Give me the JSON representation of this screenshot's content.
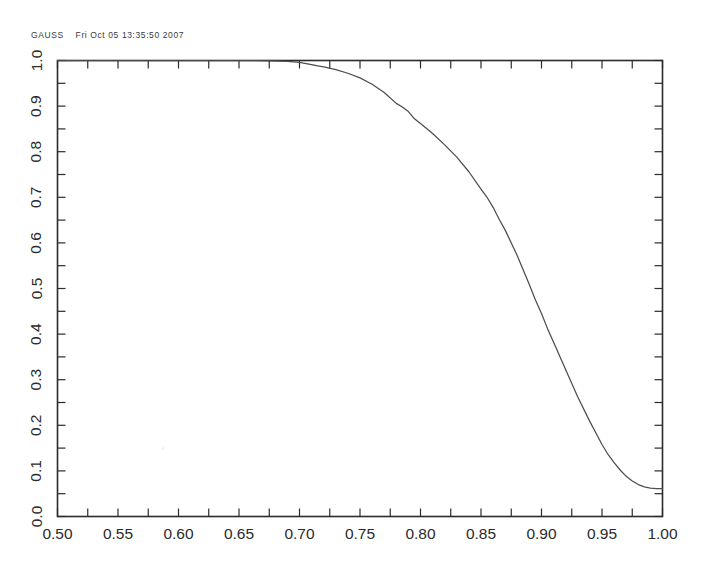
{
  "header": {
    "program": "GAUSS",
    "timestamp": "Fri Oct 05 13:35:50 2007",
    "full": "GAUSS    Fri Oct 05 13:35:50 2007"
  },
  "colors": {
    "curve": "#4d4d4d",
    "axis": "#2b2b2b",
    "text": "#2b2b2b",
    "header_text": "#3a3a3a",
    "background": "#ffffff"
  },
  "chart_data": {
    "type": "line",
    "title": "",
    "subtitle": "",
    "xlabel": "",
    "ylabel": "",
    "xlim": [
      0.5,
      1.0
    ],
    "ylim": [
      0.0,
      1.0
    ],
    "grid": false,
    "legend": null,
    "legend_position": "none",
    "xticks": [
      0.5,
      0.55,
      0.6,
      0.65,
      0.7,
      0.75,
      0.8,
      0.85,
      0.9,
      0.95,
      1.0
    ],
    "xticklabels": [
      "0.50",
      "0.55",
      "0.60",
      "0.65",
      "0.70",
      "0.75",
      "0.80",
      "0.85",
      "0.90",
      "0.95",
      "1.00"
    ],
    "xtick_minor_step": 0.025,
    "yticks": [
      0.0,
      0.1,
      0.2,
      0.3,
      0.4,
      0.5,
      0.6,
      0.7,
      0.8,
      0.9,
      1.0
    ],
    "yticklabels": [
      "0.0",
      "0.1",
      "0.2",
      "0.3",
      "0.4",
      "0.5",
      "0.6",
      "0.7",
      "0.8",
      "0.9",
      "1.0"
    ],
    "ytick_minor_step": 0.05,
    "ylabel_rotation": -90,
    "series": [
      {
        "name": "power",
        "x": [
          0.5,
          0.52,
          0.54,
          0.56,
          0.58,
          0.6,
          0.62,
          0.64,
          0.66,
          0.675,
          0.69,
          0.7,
          0.71,
          0.715,
          0.72,
          0.73,
          0.74,
          0.75,
          0.76,
          0.77,
          0.78,
          0.785,
          0.79,
          0.795,
          0.8,
          0.81,
          0.82,
          0.83,
          0.84,
          0.85,
          0.855,
          0.86,
          0.865,
          0.87,
          0.88,
          0.89,
          0.895,
          0.9,
          0.905,
          0.91,
          0.92,
          0.93,
          0.94,
          0.95,
          0.955,
          0.96,
          0.965,
          0.97,
          0.975,
          0.98,
          0.985,
          0.99,
          0.995,
          1.0
        ],
        "y": [
          1.0,
          1.0,
          1.0,
          1.0,
          1.0,
          1.0,
          1.0,
          1.0,
          1.0,
          0.999,
          0.998,
          0.996,
          0.991,
          0.988,
          0.986,
          0.98,
          0.972,
          0.962,
          0.948,
          0.93,
          0.906,
          0.898,
          0.888,
          0.872,
          0.862,
          0.84,
          0.815,
          0.788,
          0.756,
          0.718,
          0.7,
          0.678,
          0.652,
          0.628,
          0.572,
          0.508,
          0.475,
          0.445,
          0.412,
          0.382,
          0.322,
          0.262,
          0.208,
          0.158,
          0.136,
          0.118,
          0.102,
          0.088,
          0.078,
          0.07,
          0.065,
          0.062,
          0.061,
          0.061
        ]
      }
    ]
  }
}
